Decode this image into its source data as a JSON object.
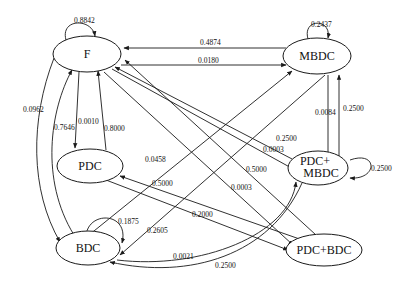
{
  "diagram": {
    "type": "state-transition-graph",
    "nodes": {
      "F": {
        "label": "F"
      },
      "MBDC": {
        "label": "MBDC"
      },
      "PDC": {
        "label": "PDC"
      },
      "PDC_MBDC": {
        "label_line1": "PDC+",
        "label_line2": "MBDC"
      },
      "BDC": {
        "label": "BDC"
      },
      "PDC_BDC": {
        "label": "PDC+BDC"
      }
    },
    "edges": [
      {
        "id": "F_self",
        "from": "F",
        "to": "F",
        "label": "0.8842"
      },
      {
        "id": "MBDC_self",
        "from": "MBDC",
        "to": "MBDC",
        "label": "0.2437"
      },
      {
        "id": "MBDC_to_F",
        "from": "MBDC",
        "to": "F",
        "label": "0.4874"
      },
      {
        "id": "F_to_MBDC",
        "from": "F",
        "to": "MBDC",
        "label": "0.0180"
      },
      {
        "id": "F_to_BDC",
        "from": "F",
        "to": "BDC",
        "label": "0.0962"
      },
      {
        "id": "BDC_to_F",
        "from": "BDC",
        "to": "F",
        "label": "0.7646"
      },
      {
        "id": "F_to_PDC",
        "from": "F",
        "to": "PDC",
        "label": "0.0010"
      },
      {
        "id": "PDC_to_F",
        "from": "PDC",
        "to": "F",
        "label": "0.8000"
      },
      {
        "id": "MBDC_to_PDCMBDC",
        "from": "MBDC",
        "to": "PDC_MBDC",
        "label": "0.0084"
      },
      {
        "id": "PDCMBDC_to_MBDC",
        "from": "PDC_MBDC",
        "to": "MBDC",
        "label": "0.2500"
      },
      {
        "id": "PDCMBDC_self",
        "from": "PDC_MBDC",
        "to": "PDC_MBDC",
        "label": "0.2500"
      },
      {
        "id": "F_to_PDCMBDC",
        "from": "F",
        "to": "PDC_MBDC",
        "label": "0.0003"
      },
      {
        "id": "PDCMBDC_to_F",
        "from": "PDC_MBDC",
        "to": "F",
        "label": "0.2500"
      },
      {
        "id": "F_to_PDCBDC",
        "from": "F",
        "to": "PDC_BDC",
        "label": "0.0003"
      },
      {
        "id": "PDCBDC_to_F",
        "from": "PDC_BDC",
        "to": "F",
        "label": "0.5000"
      },
      {
        "id": "BDC_to_MBDC",
        "from": "BDC",
        "to": "MBDC",
        "label": "0.0458"
      },
      {
        "id": "PDCBDC_to_PDC",
        "from": "PDC_BDC",
        "to": "PDC",
        "label": "0.5000"
      },
      {
        "id": "PDC_to_PDCBDC",
        "from": "PDC",
        "to": "PDC_BDC",
        "label": "0.2000"
      },
      {
        "id": "BDC_self",
        "from": "BDC",
        "to": "BDC",
        "label": "0.1875"
      },
      {
        "id": "MBDC_to_BDC",
        "from": "MBDC",
        "to": "BDC",
        "label": "0.2605"
      },
      {
        "id": "BDC_to_PDCMBDC",
        "from": "BDC",
        "to": "PDC_MBDC",
        "label": "0.0021"
      },
      {
        "id": "PDCMBDC_to_BDC",
        "from": "PDC_MBDC",
        "to": "BDC",
        "label": "0.2500"
      }
    ]
  },
  "colors": {
    "stroke": "#1a1a1a",
    "background": "#ffffff"
  }
}
